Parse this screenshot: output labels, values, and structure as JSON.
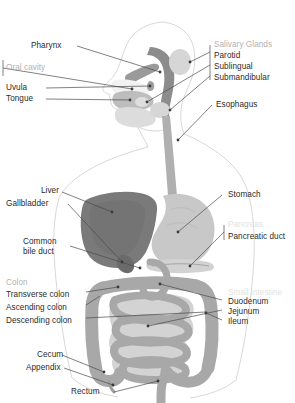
{
  "figure": {
    "style": "grayscale medical illustration with leader-line callout labels",
    "width": 295,
    "height": 403,
    "background_color": "#ffffff"
  },
  "colors": {
    "label_text": "#2b2b2b",
    "group_header_text": "#b2b2b2",
    "group_header_faint": "#e2e2e2",
    "leader_line": "#4a4a4a",
    "body_outline": "#cfcfcf",
    "pharynx_dark": "#8c8c8c",
    "liver_dark": "#7a7a7a",
    "stomach_light": "#c8c8c8",
    "intestine_mid": "#a8a8a8",
    "gland_light": "#d8d8d8",
    "esophagus": "#b0b0b0"
  },
  "labels": {
    "pharynx": "Pharynx",
    "oral_cavity_group": "Oral cavity",
    "uvula": "Uvula",
    "tongue": "Tongue",
    "salivary_glands_group": "Salivary Glands",
    "parotid": "Parotid",
    "sublingual": "Sublingual",
    "submandibular": "Submandibular",
    "esophagus": "Esophagus",
    "liver": "Liver",
    "gallbladder": "Gallbladder",
    "common_bile_duct": "Common bile duct",
    "stomach": "Stomach",
    "pancreas_group": "Pancreas",
    "pancreatic_duct": "Pancreatic duct",
    "colon_group": "Colon",
    "transverse_colon": "Transverse colon",
    "ascending_colon": "Ascending colon",
    "descending_colon": "Descending colon",
    "small_intestine_group": "Small intestine",
    "duodenum": "Duodenum",
    "jejunum": "Jejunum",
    "ileum": "Ileum",
    "cecum": "Cecum",
    "appendix": "Appendix",
    "rectum": "Rectum"
  },
  "organs": [
    {
      "name": "pharynx",
      "region": "head",
      "shade": "dark"
    },
    {
      "name": "tongue",
      "region": "head",
      "shade": "mid"
    },
    {
      "name": "uvula",
      "region": "head",
      "shade": "mid"
    },
    {
      "name": "parotid-gland",
      "region": "head",
      "shade": "light"
    },
    {
      "name": "sublingual-gland",
      "region": "head",
      "shade": "light"
    },
    {
      "name": "submandibular-gland",
      "region": "head",
      "shade": "light"
    },
    {
      "name": "esophagus",
      "region": "thorax",
      "shade": "mid"
    },
    {
      "name": "stomach",
      "region": "abdomen",
      "shade": "light"
    },
    {
      "name": "liver",
      "region": "abdomen",
      "shade": "dark"
    },
    {
      "name": "gallbladder",
      "region": "abdomen",
      "shade": "dark"
    },
    {
      "name": "pancreas",
      "region": "abdomen",
      "shade": "light"
    },
    {
      "name": "duodenum",
      "region": "abdomen",
      "shade": "mid"
    },
    {
      "name": "jejunum",
      "region": "abdomen",
      "shade": "mid"
    },
    {
      "name": "ileum",
      "region": "abdomen",
      "shade": "mid"
    },
    {
      "name": "transverse-colon",
      "region": "abdomen",
      "shade": "mid"
    },
    {
      "name": "ascending-colon",
      "region": "abdomen",
      "shade": "mid"
    },
    {
      "name": "descending-colon",
      "region": "abdomen",
      "shade": "mid"
    },
    {
      "name": "cecum",
      "region": "abdomen",
      "shade": "mid"
    },
    {
      "name": "appendix",
      "region": "abdomen",
      "shade": "mid"
    },
    {
      "name": "rectum",
      "region": "pelvis",
      "shade": "mid"
    }
  ]
}
